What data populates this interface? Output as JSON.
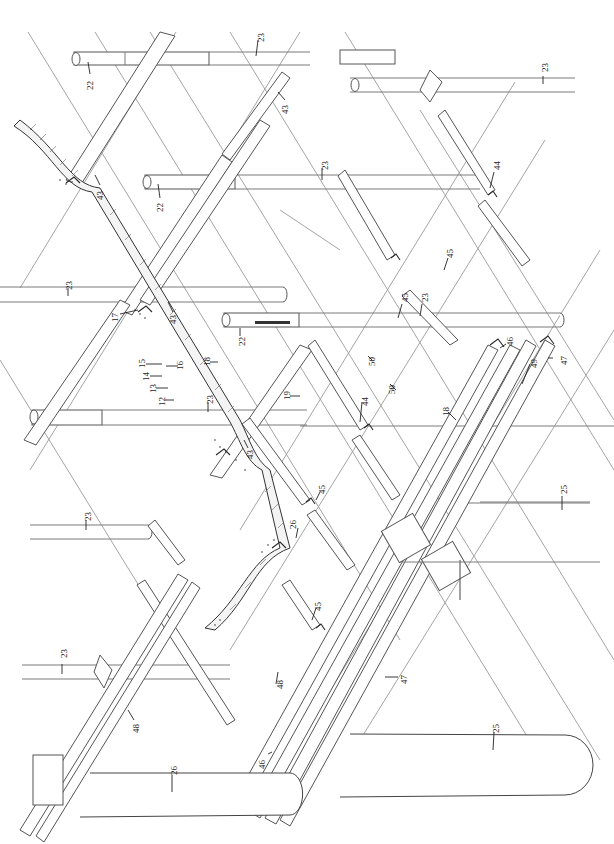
{
  "figure": {
    "type": "exploded isometric structural drawing",
    "orientation": "rotated 90 degrees",
    "background": "#ffffff",
    "line_color": "#555555"
  },
  "labels": [
    {
      "id": "l22a",
      "text": "22",
      "x": 90,
      "y": 80,
      "rot": -90
    },
    {
      "id": "l23a",
      "text": "23",
      "x": 260,
      "y": 36,
      "rot": -90
    },
    {
      "id": "l43a",
      "text": "43",
      "x": 285,
      "y": 108,
      "rot": -90
    },
    {
      "id": "l43b",
      "text": "43",
      "x": 100,
      "y": 193,
      "rot": -90
    },
    {
      "id": "l22b",
      "text": "22",
      "x": 160,
      "y": 205,
      "rot": -90
    },
    {
      "id": "l23b",
      "text": "23",
      "x": 325,
      "y": 163,
      "rot": -90
    },
    {
      "id": "l23c",
      "text": "23",
      "x": 545,
      "y": 68,
      "rot": -90
    },
    {
      "id": "l44a",
      "text": "44",
      "x": 497,
      "y": 165,
      "rot": -90
    },
    {
      "id": "l45a",
      "text": "45",
      "x": 450,
      "y": 252,
      "rot": -90
    },
    {
      "id": "l23d",
      "text": "23",
      "x": 70,
      "y": 285,
      "rot": -90
    },
    {
      "id": "l17",
      "text": "17",
      "x": 116,
      "y": 318,
      "rot": -90
    },
    {
      "id": "l43c",
      "text": "43",
      "x": 173,
      "y": 318,
      "rot": -90
    },
    {
      "id": "l22c",
      "text": "22",
      "x": 242,
      "y": 340,
      "rot": -90
    },
    {
      "id": "l45b",
      "text": "45",
      "x": 405,
      "y": 298,
      "rot": -90
    },
    {
      "id": "l23e",
      "text": "23",
      "x": 425,
      "y": 298,
      "rot": -90
    },
    {
      "id": "l15",
      "text": "15",
      "x": 142,
      "y": 362,
      "rot": -90
    },
    {
      "id": "l16",
      "text": "16",
      "x": 180,
      "y": 364,
      "rot": -90
    },
    {
      "id": "l14",
      "text": "14",
      "x": 146,
      "y": 375,
      "rot": -90
    },
    {
      "id": "l18a",
      "text": "18",
      "x": 207,
      "y": 362,
      "rot": -90
    },
    {
      "id": "l13",
      "text": "13",
      "x": 153,
      "y": 387,
      "rot": -90
    },
    {
      "id": "l12",
      "text": "12",
      "x": 162,
      "y": 400,
      "rot": -90
    },
    {
      "id": "l23f",
      "text": "23",
      "x": 210,
      "y": 400,
      "rot": -90
    },
    {
      "id": "l19",
      "text": "19",
      "x": 287,
      "y": 395,
      "rot": -90
    },
    {
      "id": "l50a",
      "text": "50",
      "x": 372,
      "y": 360,
      "rot": -90
    },
    {
      "id": "l50b",
      "text": "50",
      "x": 392,
      "y": 388,
      "rot": -90
    },
    {
      "id": "l46a",
      "text": "46",
      "x": 510,
      "y": 340,
      "rot": -90
    },
    {
      "id": "l49",
      "text": "49",
      "x": 534,
      "y": 362,
      "rot": -90
    },
    {
      "id": "l47a",
      "text": "47",
      "x": 564,
      "y": 359,
      "rot": -90
    },
    {
      "id": "l43d",
      "text": "43",
      "x": 250,
      "y": 453,
      "rot": -90
    },
    {
      "id": "l44b",
      "text": "44",
      "x": 365,
      "y": 400,
      "rot": -90
    },
    {
      "id": "l18b",
      "text": "18",
      "x": 446,
      "y": 410,
      "rot": -90
    },
    {
      "id": "l23g",
      "text": "23",
      "x": 88,
      "y": 515,
      "rot": -90
    },
    {
      "id": "l45c",
      "text": "45",
      "x": 322,
      "y": 488,
      "rot": -90
    },
    {
      "id": "l26a",
      "text": "26",
      "x": 293,
      "y": 523,
      "rot": -90
    },
    {
      "id": "l25a",
      "text": "25",
      "x": 564,
      "y": 488,
      "rot": -90
    },
    {
      "id": "l45d",
      "text": "45",
      "x": 318,
      "y": 605,
      "rot": -90
    },
    {
      "id": "l23h",
      "text": "23",
      "x": 64,
      "y": 652,
      "rot": -90
    },
    {
      "id": "l48a",
      "text": "48",
      "x": 280,
      "y": 683,
      "rot": -90
    },
    {
      "id": "l47b",
      "text": "47",
      "x": 404,
      "y": 678,
      "rot": -90
    },
    {
      "id": "l25b",
      "text": "25",
      "x": 496,
      "y": 727,
      "rot": -90
    },
    {
      "id": "l48b",
      "text": "48",
      "x": 136,
      "y": 727,
      "rot": -90
    },
    {
      "id": "l46b",
      "text": "46",
      "x": 262,
      "y": 763,
      "rot": -90
    },
    {
      "id": "l26b",
      "text": "26",
      "x": 174,
      "y": 769,
      "rot": -90
    }
  ],
  "components": {
    "pipes_22": 3,
    "pipes_23": 8,
    "beams_43": 4,
    "channels_44": 2,
    "channels_45": 4,
    "tanks_25": 1,
    "tanks_26": 1,
    "rails_47_48_49": 3,
    "concrete_layers": [
      "12",
      "13",
      "14",
      "15",
      "16",
      "17"
    ]
  }
}
